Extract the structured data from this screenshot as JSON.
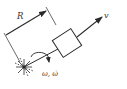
{
  "diagram": {
    "labels": {
      "radius": "R",
      "velocity": "v",
      "angular": "ω, ω̇"
    },
    "colors": {
      "stroke": "#2a2a2a",
      "box_fill": "#ffffff",
      "background": "#ffffff"
    },
    "elements": {
      "pivot": "rotation-center",
      "rod": "arm-from-pivot-to-mass",
      "mass": "square-block",
      "velocity_arrow": "tangential-direction",
      "rotation_arrow": "curved-angular-velocity-arrow",
      "dimension": "radius-R-dimension-line"
    }
  }
}
